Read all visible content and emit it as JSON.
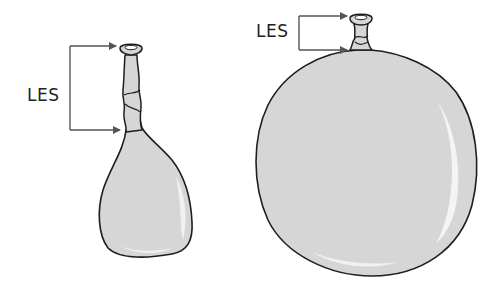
{
  "diagram": {
    "type": "illustration",
    "colors": {
      "balloon_fill": "#d6d6d6",
      "outline": "#1e1e1e",
      "arrow": "#555555",
      "highlight": "#f4f4f4",
      "text": "#222222"
    },
    "figures": [
      {
        "id": "small-balloon",
        "label": "LES",
        "description": "Partially inflated balloon with long neck; LES bracket spans the long neck"
      },
      {
        "id": "large-balloon",
        "label": "LES",
        "description": "Fully inflated balloon with short neck; LES bracket spans the short neck"
      }
    ]
  }
}
